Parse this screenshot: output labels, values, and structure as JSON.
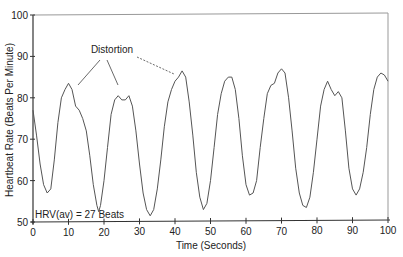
{
  "chart_data": {
    "type": "line",
    "title": "",
    "xlabel": "Time (Seconds)",
    "ylabel": "Heartbeat Rate (Beats Per Minute)",
    "xlim": [
      0,
      100
    ],
    "ylim": [
      50,
      100
    ],
    "xticks": [
      0,
      10,
      20,
      30,
      40,
      50,
      60,
      70,
      80,
      90,
      100
    ],
    "yticks": [
      50,
      60,
      70,
      80,
      90,
      100
    ],
    "grid": false,
    "legend": null,
    "annotations": [
      {
        "text": "Distortion",
        "x": 27,
        "y": 90.5,
        "pointers_to": [
          [
            10,
            82
          ],
          [
            27,
            81
          ],
          [
            41,
            86
          ]
        ]
      },
      {
        "text": "HRV(av) = 27 Beats",
        "x": 0.5,
        "y": 52
      }
    ],
    "series": [
      {
        "name": "Heartbeat Rate",
        "color": "#555555",
        "x": [
          0,
          1,
          2,
          3,
          4,
          5,
          6,
          7,
          8,
          9,
          10,
          11,
          12,
          13,
          14,
          15,
          16,
          17,
          18,
          18.5,
          19,
          20,
          21,
          22,
          23,
          24,
          25,
          26,
          27,
          28,
          29,
          30,
          31,
          32,
          33,
          34,
          35,
          36,
          37,
          38,
          39,
          40,
          41,
          42,
          43,
          44,
          45,
          46,
          47,
          48,
          49,
          50,
          51,
          52,
          53,
          54,
          55,
          56,
          57,
          58,
          59,
          60,
          61,
          62,
          63,
          64,
          65,
          66,
          67,
          68,
          69,
          70,
          71,
          72,
          73,
          74,
          75,
          76,
          77,
          78,
          79,
          80,
          81,
          82,
          83,
          84,
          85,
          86,
          87,
          88,
          89,
          90,
          91,
          92,
          93,
          94,
          95,
          96,
          97,
          98,
          99,
          100
        ],
        "values": [
          77,
          71,
          64,
          59,
          57,
          58,
          65,
          74,
          80,
          82,
          83.5,
          82,
          78,
          77,
          75,
          72,
          66,
          59,
          54,
          52.5,
          54,
          60,
          68,
          76,
          79.5,
          80.5,
          79.5,
          79.5,
          80.5,
          78,
          72,
          64,
          57,
          53,
          51.5,
          53,
          58,
          65,
          73,
          79,
          82,
          84,
          85,
          86.5,
          85,
          79,
          71,
          62,
          56,
          53,
          54.5,
          60,
          68,
          76,
          81,
          84,
          85,
          85,
          82,
          75,
          66,
          59,
          56.5,
          57,
          60,
          68,
          75,
          81,
          83,
          83.5,
          86,
          87,
          86,
          80,
          72,
          63,
          57,
          54,
          53.5,
          56,
          62,
          70,
          78,
          82,
          84,
          82,
          80.5,
          81.5,
          80,
          72,
          63,
          58,
          56.5,
          58,
          62,
          68,
          76,
          82,
          85,
          86,
          85.5,
          84
        ]
      }
    ]
  }
}
